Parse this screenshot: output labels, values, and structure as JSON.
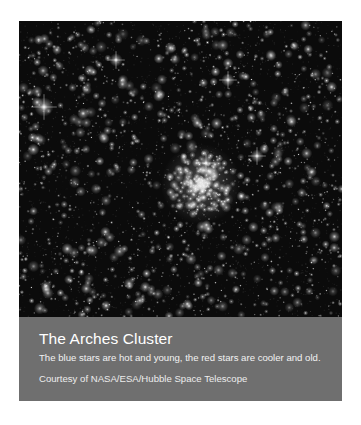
{
  "figure": {
    "photo": {
      "subject": "Arches Cluster starfield",
      "background_color": "#0b0b0b",
      "cluster_center": [
        201,
        184
      ],
      "bright_stars": [
        [
          44,
          107
        ],
        [
          206,
          163
        ],
        [
          257,
          156
        ],
        [
          116,
          60
        ],
        [
          228,
          80
        ]
      ],
      "star_count": 1400,
      "seed": 7
    },
    "caption": {
      "title": "The Arches Cluster",
      "description": "The blue stars are hot and young, the red stars are cooler and old.",
      "credit": "Courtesy of NASA/ESA/Hubble Space Telescope",
      "background_color": "#6f6f6f"
    }
  }
}
